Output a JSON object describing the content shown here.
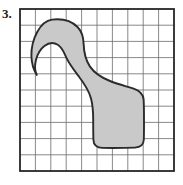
{
  "figure": {
    "problem_label": "3.",
    "caption": "",
    "type": "grid-area-estimation"
  },
  "grid": {
    "columns": 10,
    "rows": 10,
    "left": 20,
    "top": 9,
    "width": 154,
    "height": 162,
    "cell_width": 15.4,
    "cell_height": 16.2,
    "line_color": "#6b6b6b",
    "line_width": 0.8,
    "border_color": "#262626",
    "border_width": 1.8,
    "background": "#ffffff"
  },
  "region": {
    "name": "irregular-blob",
    "fill_color": "#c9c9c9",
    "stroke_color": "#2b2b2b",
    "stroke_width": 1.9,
    "description": "Irregular bone-shaped region with a rounded bulb in the upper left, a narrow waist through the middle, and a large rounded-rectangular lobe in the lower right.",
    "path": "M 52.0 19.6 C 62.5 18.4 71.8 21.2 77.5 27.0 C 82.0 31.6 83.4 37.4 83.6 43.6 C 83.9 52.4 85.6 60.2 90.0 66.6 C 94.5 73.2 101.5 77.6 110.0 81.0 C 118.5 84.4 127.0 86.4 133.6 88.6 C 139.6 90.6 143.2 93.6 143.6 99.4 C 143.9 104.0 144.0 112.0 144.0 121.0 C 144.0 128.6 144.0 135.4 143.8 139.8 C 143.5 145.2 140.6 147.4 135.0 147.6 C 127.0 147.9 112.0 148.0 102.5 147.9 C 96.2 147.8 93.6 145.4 93.4 139.8 C 93.2 133.2 93.2 126.0 93.2 120.0 C 93.2 112.0 92.8 105.0 91.0 98.4 C 88.8 90.4 84.4 83.8 79.2 77.0 C 74.2 70.4 69.6 64.6 66.6 58.2 C 64.0 52.8 62.6 47.8 57.8 44.8 C 53.6 42.2 48.6 42.8 44.4 46.0 C 40.2 49.2 37.4 54.2 36.0 59.8 C 34.6 65.4 34.8 71.0 36.8 75.0 C 33.6 70.0 31.6 63.4 31.4 56.0 C 31.2 47.8 33.4 39.0 37.2 32.0 C 41.0 25.0 46.0 20.4 52.0 19.6 Z"
  },
  "colors": {
    "page_background": "#ffffff",
    "grid_line": "#6b6b6b",
    "grid_border": "#262626",
    "region_fill": "#c9c9c9",
    "region_stroke": "#2b2b2b",
    "label_text": "#1a1a1a"
  }
}
